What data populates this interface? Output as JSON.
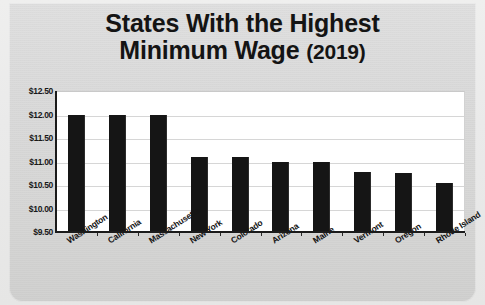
{
  "title": {
    "line1": "States With the Highest",
    "line2": "Minimum Wage",
    "year": "(2019)"
  },
  "chart_data": {
    "type": "bar",
    "title": "States With the Highest Minimum Wage (2019)",
    "xlabel": "",
    "ylabel": "",
    "ylim": [
      9.5,
      12.5
    ],
    "grid": true,
    "legend": false,
    "ytick_labels": [
      "$12.50",
      "$12.00",
      "$11.50",
      "$11.00",
      "$10.50",
      "$10.00",
      "$9.50"
    ],
    "ytick_values": [
      12.5,
      12.0,
      11.5,
      11.0,
      10.5,
      10.0,
      9.5
    ],
    "categories": [
      "Washington",
      "California",
      "Massachusetts",
      "New York",
      "Colorado",
      "Arizona",
      "Maine",
      "Vermont",
      "Oregon",
      "Rhode Island"
    ],
    "values": [
      12.0,
      12.0,
      12.0,
      11.1,
      11.1,
      11.0,
      11.0,
      10.78,
      10.75,
      10.55
    ],
    "bar_color": "#151515",
    "plot_background": "#ffffff",
    "card_background": "#d9d9d9"
  }
}
